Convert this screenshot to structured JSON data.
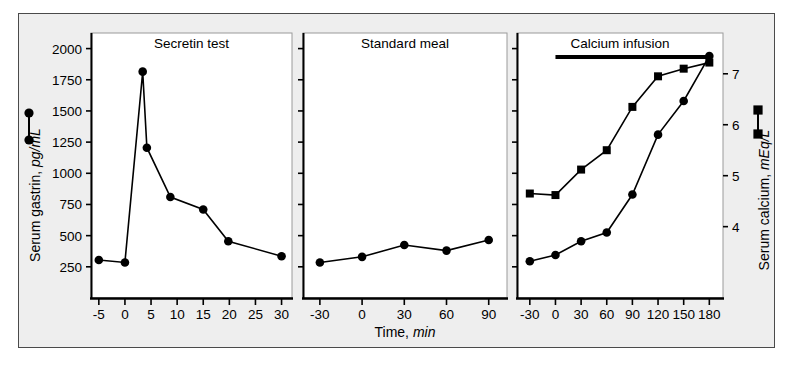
{
  "figure": {
    "background_color": "#eeeeee",
    "page_color": "#ffffff",
    "border_color": "#4a4a4a",
    "ink_color": "#000000"
  },
  "axes": {
    "left_axis_title": "Serum gastrin, pg/mL",
    "left_axis_title_plain": "Serum gastrin,",
    "left_axis_title_italic": "pg/mL",
    "right_axis_title_plain": "Serum calcium,",
    "right_axis_title_italic": "mEq/L",
    "x_axis_title_plain": "Time,",
    "x_axis_title_italic": "min",
    "left_ticks": [
      "250",
      "500",
      "750",
      "1000",
      "1250",
      "1500",
      "1750",
      "2000"
    ],
    "right_ticks": [
      "4",
      "5",
      "6",
      "7"
    ]
  },
  "legend": {
    "gastrin_marker": "circle-marker",
    "calcium_marker": "square-marker"
  },
  "annotations": {
    "infusion_bar_label": "calcium-infusion-bar"
  },
  "chart_data": {
    "type": "line",
    "title": "",
    "xlabel": "Time, min",
    "ylabel": "Serum gastrin, pg/mL",
    "y2label": "Serum calcium, mEq/L",
    "ylim": [
      0,
      2125
    ],
    "y2lim": [
      2.6,
      7.8
    ],
    "yticks": [
      250,
      500,
      750,
      1000,
      1250,
      1500,
      1750,
      2000
    ],
    "y2ticks": [
      4,
      5,
      6,
      7
    ],
    "grid": false,
    "legend_position": "outside-left-and-right",
    "panels": [
      {
        "name": "secretin-test",
        "title": "Secretin test",
        "xlim": [
          -6.5,
          32
        ],
        "xticks": [
          -5,
          0,
          5,
          10,
          15,
          20,
          25,
          30
        ],
        "xticklabels": [
          "-5",
          "0",
          "5",
          "10",
          "15",
          "20",
          "25",
          "30"
        ],
        "series": [
          {
            "name": "Serum gastrin",
            "marker": "circle",
            "axis": "left",
            "x": [
              -5,
              0,
              3.4,
              4.2,
              8.7,
              15,
              19.8,
              30
            ],
            "values": [
              305,
              285,
              1815,
              1205,
              810,
              710,
              455,
              335
            ]
          }
        ],
        "infusion_bar": null
      },
      {
        "name": "standard-meal",
        "title": "Standard meal",
        "xlim": [
          -42,
          103
        ],
        "xticks": [
          -30,
          0,
          30,
          60,
          90
        ],
        "xticklabels": [
          "-30",
          "0",
          "30",
          "60",
          "90"
        ],
        "series": [
          {
            "name": "Serum gastrin",
            "marker": "circle",
            "axis": "left",
            "x": [
              -30,
              0,
              30,
              60,
              90
            ],
            "values": [
              285,
              330,
              425,
              380,
              465
            ]
          }
        ],
        "infusion_bar": null
      },
      {
        "name": "calcium-infusion",
        "title": "Calcium infusion",
        "xlim": [
          -45,
          196
        ],
        "xticks": [
          -30,
          0,
          30,
          60,
          90,
          120,
          150,
          180
        ],
        "xticklabels": [
          "-30",
          "0",
          "30",
          "60",
          "90",
          "120",
          "150",
          "180"
        ],
        "series": [
          {
            "name": "Serum gastrin",
            "marker": "circle",
            "axis": "left",
            "x": [
              -30,
              0,
              30,
              60,
              90,
              120,
              150,
              180
            ],
            "values": [
              295,
              345,
              455,
              525,
              830,
              1310,
              1580,
              1940
            ]
          },
          {
            "name": "Serum calcium",
            "marker": "square",
            "axis": "right",
            "x": [
              -30,
              0,
              30,
              60,
              90,
              120,
              150,
              180
            ],
            "values": [
              4.65,
              4.62,
              5.12,
              5.5,
              6.35,
              6.95,
              7.1,
              7.22
            ]
          }
        ],
        "infusion_bar": {
          "from": 0,
          "to": 180
        }
      }
    ]
  }
}
